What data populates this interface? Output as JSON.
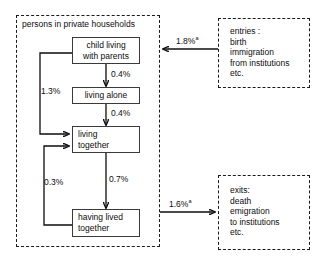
{
  "diagram": {
    "title": "",
    "household_group": {
      "label": "persons in private households"
    },
    "nodes": {
      "child_with_parents": {
        "line1": "child living",
        "line2": "with parents"
      },
      "living_alone": {
        "line1": "living alone",
        "line2": ""
      },
      "living_together": {
        "line1": "living",
        "line2": "together"
      },
      "having_lived_together": {
        "line1": "having lived",
        "line2": "together"
      }
    },
    "external": {
      "entries": {
        "line1": "entries :",
        "line2": "birth",
        "line3": "immigration",
        "line4": "from institutions",
        "line5": "etc."
      },
      "exits": {
        "line1": "exits:",
        "line2": "death",
        "line3": "emigration",
        "line4": "to institutions",
        "line5": "etc."
      }
    },
    "edges": {
      "entries_in": {
        "value": "1.8%",
        "note": "a"
      },
      "child_to_alone": {
        "value": "0.4%",
        "note": ""
      },
      "alone_to_together": {
        "value": "0.4%",
        "note": ""
      },
      "child_to_together": {
        "value": "1.3%",
        "note": ""
      },
      "together_to_hlt": {
        "value": "0.7%",
        "note": ""
      },
      "hlt_to_together": {
        "value": "0.3%",
        "note": ""
      },
      "exits_out": {
        "value": "1.6%",
        "note": "a"
      }
    }
  }
}
